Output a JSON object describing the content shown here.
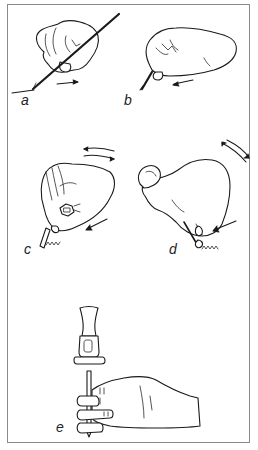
{
  "figure": {
    "border_color": "#8a8a8a",
    "ink_color": "#1a1a1a",
    "panels": [
      {
        "id": "a",
        "label": "a",
        "content": "hand holding long rod at an angle, arrow pointing right"
      },
      {
        "id": "b",
        "label": "b",
        "content": "hand holding short tool with fingertips, arrow pointing left"
      },
      {
        "id": "c",
        "label": "c",
        "content": "hand holding tool with hex nut, curved double arrows, diagonal arrow, zigzag mark"
      },
      {
        "id": "d",
        "label": "d",
        "content": "hand gripping fine tool, curved double arrows, diagonal arrow, zigzag mark"
      },
      {
        "id": "e",
        "label": "e",
        "content": "hammer above punch held vertically in hand"
      }
    ]
  }
}
